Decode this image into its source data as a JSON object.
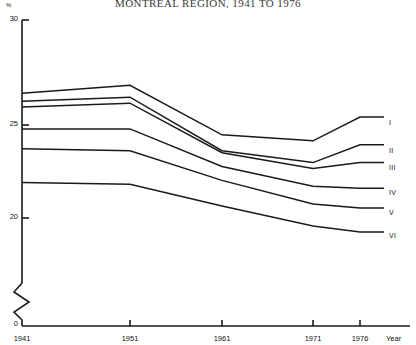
{
  "title": "MONTREAL REGION, 1941 TO 1976",
  "axis": {
    "y_unit": "%",
    "x_name": "Year",
    "y_ticks": [
      "30",
      "25",
      "20",
      "0"
    ],
    "x_ticks": [
      "1941",
      "1951",
      "1961",
      "1971",
      "1976"
    ]
  },
  "chart_data": {
    "type": "line",
    "title": "MONTREAL REGION, 1941 TO 1976",
    "xlabel": "Year",
    "ylabel": "%",
    "ylim": [
      0,
      30
    ],
    "y_axis_break": true,
    "y_visible_range": [
      19,
      30
    ],
    "grid": false,
    "legend_position": "right-end-of-line",
    "x": [
      1941,
      1951,
      1961,
      1971,
      1976
    ],
    "series": [
      {
        "name": "I",
        "label": "I",
        "values": [
          26.3,
          26.7,
          24.2,
          23.9,
          25.1
        ]
      },
      {
        "name": "II",
        "label": "II",
        "values": [
          25.9,
          26.1,
          23.4,
          22.8,
          23.7
        ]
      },
      {
        "name": "III",
        "label": "III",
        "values": [
          25.6,
          25.8,
          23.3,
          22.5,
          22.8
        ]
      },
      {
        "name": "IV",
        "label": "IV",
        "values": [
          24.5,
          24.5,
          22.6,
          21.6,
          21.5
        ]
      },
      {
        "name": "V",
        "label": "V",
        "values": [
          23.5,
          23.4,
          21.9,
          20.7,
          20.5
        ]
      },
      {
        "name": "VI",
        "label": "VI",
        "values": [
          21.8,
          21.7,
          20.6,
          19.6,
          19.3
        ]
      }
    ]
  },
  "series_labels": [
    "I",
    "II",
    "III",
    "IV",
    "V",
    "VI"
  ],
  "colors": {
    "line": "#1a1a1a",
    "axis": "#1a1a1a",
    "background": "#ffffff"
  }
}
